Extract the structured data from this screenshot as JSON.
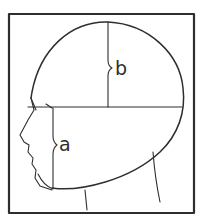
{
  "figure": {
    "labels": {
      "a": "a",
      "b": "b"
    },
    "colors": {
      "line": "#2e2e2e",
      "background": "#ffffff"
    }
  }
}
